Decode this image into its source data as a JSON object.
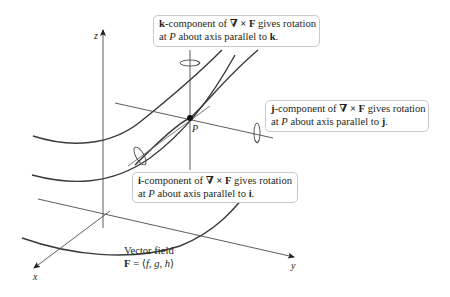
{
  "figure": {
    "type": "3d-curl-diagram",
    "axes": {
      "x": "x",
      "y": "y",
      "z": "z"
    },
    "point_label": "P",
    "callouts": {
      "k": {
        "vec": "k",
        "line1_rest": "-component of ",
        "operator": "∇ × F",
        "line1_tail": " gives rotation",
        "line2_prefix": "at ",
        "line2_point": "P",
        "line2_rest": " about axis parallel to ",
        "line2_vec": "k",
        "line2_end": "."
      },
      "j": {
        "vec": "j",
        "line1_rest": "-component of ",
        "operator": "∇ × F",
        "line1_tail": " gives rotation",
        "line2_prefix": "at ",
        "line2_point": "P",
        "line2_rest": " about axis parallel to ",
        "line2_vec": "j",
        "line2_end": "."
      },
      "i": {
        "vec": "i",
        "line1_rest": "-component of ",
        "operator": "∇ × F",
        "line1_tail": " gives rotation",
        "line2_prefix": "at ",
        "line2_point": "P",
        "line2_rest": " about axis parallel to ",
        "line2_vec": "i",
        "line2_end": "."
      }
    },
    "vector_field": {
      "title": "Vector field",
      "F": "F",
      "eq": " = ⟨",
      "f": "f",
      "sep1": ", ",
      "g": "g",
      "sep2": ", ",
      "h": "h",
      "close": "⟩"
    },
    "colors": {
      "line": "#4a4a4a",
      "curve": "#3a3a3a",
      "box_border": "#c9c9c9",
      "text": "#231f20"
    }
  }
}
